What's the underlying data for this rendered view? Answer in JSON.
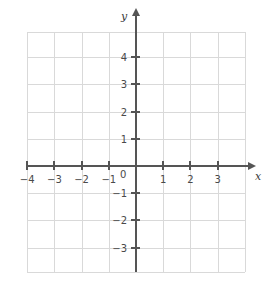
{
  "chart_data": {
    "type": "scatter",
    "title": "",
    "subtitle": "",
    "xlabel": "x",
    "ylabel": "y",
    "xlim": [
      -4,
      3.4
    ],
    "ylim": [
      -3.4,
      4.6
    ],
    "xticks": [
      -4,
      -3,
      -2,
      -1,
      1,
      2,
      3
    ],
    "yticks": [
      4,
      3,
      2,
      1,
      -1,
      -2,
      -3
    ],
    "xtick_labels": [
      "−4",
      "−3",
      "−2",
      "−1",
      "1",
      "2",
      "3"
    ],
    "ytick_labels": [
      "4",
      "3",
      "2",
      "1",
      "−1",
      "−2",
      "−3"
    ],
    "origin_label": "0",
    "grid": true,
    "grid_step": 1,
    "legend": null,
    "annotations": [],
    "series": [],
    "values": [],
    "x": []
  },
  "axes": {
    "x_name": "x",
    "y_name": "y",
    "origin": "0"
  },
  "colors": {
    "grid": "#d9d9d9",
    "axis": "#555555",
    "label": "#4a4a4a",
    "background": "#ffffff"
  }
}
